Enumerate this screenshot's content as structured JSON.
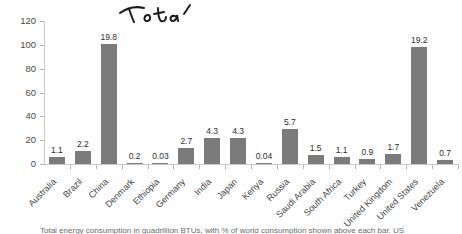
{
  "chart_data": {
    "type": "bar",
    "title": "",
    "xlabel": "",
    "ylabel": "",
    "ylim": [
      0,
      120
    ],
    "yticks": [
      0,
      20,
      40,
      60,
      80,
      100,
      120
    ],
    "grid": false,
    "legend": null,
    "bar_color": "#7b7b7b",
    "categories": [
      "Australia",
      "Brazil",
      "China",
      "Denmark",
      "Ethiopia",
      "Germany",
      "India",
      "Japan",
      "Kenya",
      "Russia",
      "Saudi Arabia",
      "South Africa",
      "Turkey",
      "United Kingdom",
      "United States",
      "Venezuela"
    ],
    "value_labels_pct": [
      "1.1",
      "2.2",
      "19.8",
      "0.2",
      "0.03",
      "2.7",
      "4.3",
      "4.3",
      "0.04",
      "5.7",
      "1.5",
      "1.1",
      "0.9",
      "1.7",
      "19.2",
      "0.7"
    ],
    "bar_heights_quadrillion_btu": [
      5.6,
      11.2,
      101,
      1.0,
      0.15,
      13.8,
      22,
      22,
      0.2,
      29,
      7.7,
      5.6,
      4.6,
      8.7,
      98,
      3.6
    ]
  },
  "annotation": {
    "handwritten_text": "Total"
  },
  "caption": {
    "text": "Total energy consumption in quadrillion BTUs, with % of world consumption shown above each bar. US"
  }
}
